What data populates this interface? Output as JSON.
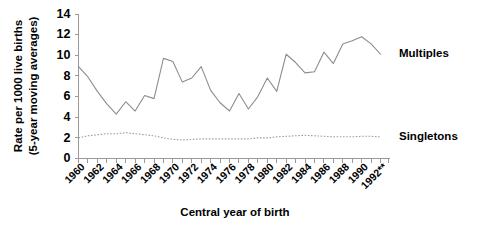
{
  "chart_data": {
    "type": "line",
    "title": "",
    "xlabel": "Central year of birth",
    "ylabel_line1": "Rate per 1000 live births",
    "ylabel_line2": "(5-year moving averages)",
    "xlim": [
      1960,
      1993
    ],
    "ylim": [
      0,
      14
    ],
    "ytick_values": [
      0,
      2,
      4,
      6,
      8,
      10,
      12,
      14
    ],
    "ytick_labels": [
      "0",
      "2",
      "4",
      "6",
      "8",
      "10",
      "12",
      "14"
    ],
    "xtick_labels": [
      "1960",
      "1962",
      "1964",
      "1966",
      "1968",
      "1970",
      "1972",
      "1974",
      "1976",
      "1978",
      "1980",
      "1982",
      "1984",
      "1986",
      "1988",
      "1990",
      "1992**"
    ],
    "xtick_values": [
      1960,
      1962,
      1964,
      1966,
      1968,
      1970,
      1972,
      1974,
      1976,
      1978,
      1980,
      1982,
      1984,
      1986,
      1988,
      1990,
      1992
    ],
    "minor_xticks": [
      1961,
      1963,
      1965,
      1967,
      1969,
      1971,
      1973,
      1975,
      1977,
      1979,
      1981,
      1983,
      1985,
      1987,
      1989,
      1991,
      1992.8
    ],
    "grid": false,
    "legend_position": "right-inline",
    "x": [
      1960,
      1961,
      1962,
      1963,
      1964,
      1965,
      1966,
      1967,
      1968,
      1969,
      1970,
      1971,
      1972,
      1973,
      1974,
      1975,
      1976,
      1977,
      1978,
      1979,
      1980,
      1981,
      1982,
      1983,
      1984,
      1985,
      1986,
      1987,
      1988,
      1989,
      1990,
      1991,
      1992
    ],
    "series": [
      {
        "name": "Multiples",
        "style": "solid",
        "color": "#8d8d8d",
        "values": [
          8.9,
          7.9,
          6.5,
          5.3,
          4.3,
          5.5,
          4.6,
          6.1,
          5.8,
          9.7,
          9.4,
          7.4,
          7.8,
          8.9,
          6.6,
          5.4,
          4.6,
          6.3,
          4.8,
          6.0,
          7.8,
          6.5,
          10.1,
          9.3,
          8.3,
          8.4,
          10.3,
          9.2,
          11.1,
          11.4,
          11.8,
          11.1,
          10.1
        ]
      },
      {
        "name": "Singletons",
        "style": "dotted",
        "color": "#9e9e9e",
        "values": [
          2.0,
          2.2,
          2.3,
          2.4,
          2.4,
          2.5,
          2.4,
          2.3,
          2.2,
          2.0,
          1.85,
          1.8,
          1.85,
          1.9,
          1.9,
          1.9,
          1.9,
          1.9,
          1.9,
          2.0,
          2.0,
          2.1,
          2.15,
          2.2,
          2.25,
          2.2,
          2.15,
          2.1,
          2.1,
          2.1,
          2.15,
          2.15,
          2.1
        ]
      }
    ],
    "annotations": [
      {
        "name": "multiples-label",
        "text": "Multiples",
        "at_value": 10.1
      },
      {
        "name": "singletons-label",
        "text": "Singletons",
        "at_value": 2.1
      }
    ]
  }
}
